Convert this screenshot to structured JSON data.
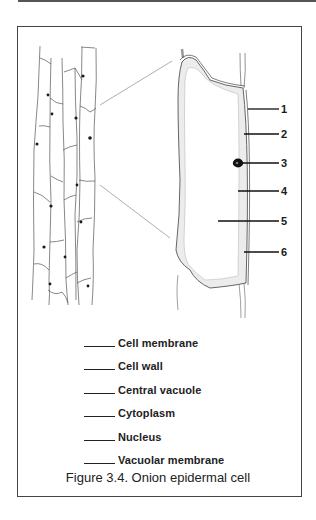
{
  "figure": {
    "caption": "Figure 3.4. Onion epidermal cell",
    "callout_numbers": [
      "1",
      "2",
      "3",
      "4",
      "5",
      "6"
    ],
    "legend_items": [
      {
        "label": "Cell membrane"
      },
      {
        "label": "Cell wall"
      },
      {
        "label": "Central vacuole"
      },
      {
        "label": "Cytoplasm"
      },
      {
        "label": "Nucleus"
      },
      {
        "label": "Vacuolar membrane"
      }
    ],
    "colors": {
      "border": "#444444",
      "line": "#333333",
      "cytoplasm_shade": "#e6e6e6",
      "nucleus": "#111111"
    }
  }
}
